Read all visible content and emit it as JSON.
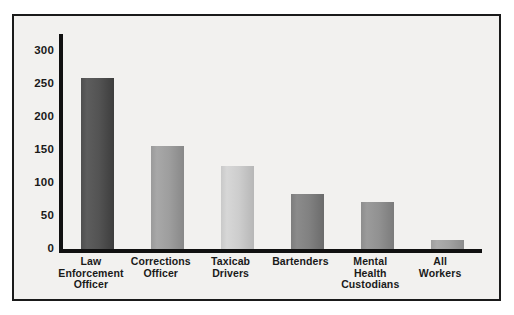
{
  "chart_data": {
    "type": "bar",
    "title": "",
    "subtitle": "",
    "xlabel": "",
    "ylabel": "",
    "ylim": [
      0,
      325
    ],
    "yticks": [
      0,
      50,
      100,
      150,
      200,
      250,
      300
    ],
    "ytick_labels": [
      "0",
      "50",
      "100",
      "150",
      "200",
      "250",
      "300"
    ],
    "grid": false,
    "legend": "none",
    "categories": [
      "Law Enforcement Officer",
      "Corrections Officer",
      "Taxicab Drivers",
      "Bartenders",
      "Mental Health Custodians",
      "All Workers"
    ],
    "category_lines": [
      [
        "Law",
        "Enforcement",
        "Officer"
      ],
      [
        "Corrections",
        "Officer"
      ],
      [
        "Taxicab",
        "Drivers"
      ],
      [
        "Bartenders"
      ],
      [
        "Mental",
        "Health",
        "Custodians"
      ],
      [
        "All",
        "Workers"
      ]
    ],
    "values": [
      259,
      156,
      125,
      83,
      71,
      13
    ],
    "bar_colors": [
      "#4f4f4f",
      "#9a9a9a",
      "#c9c9c9",
      "#7d7d7d",
      "#8d8d8d",
      "#9e9e9e"
    ]
  },
  "style": {
    "frame_border_color": "#1a1a1a",
    "plot_background": "#f2f1ef",
    "axis_color": "#111111",
    "text_color": "#1a1a1a"
  }
}
